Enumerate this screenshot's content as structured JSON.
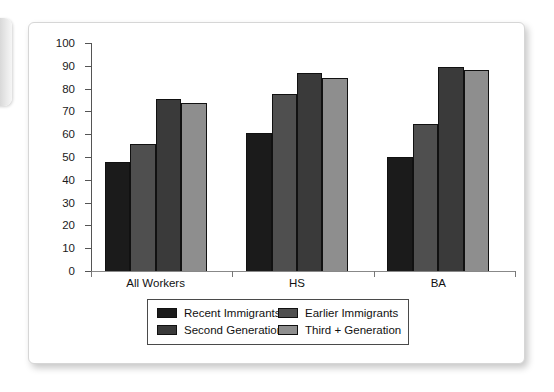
{
  "chart_data": {
    "type": "bar",
    "title": "",
    "xlabel": "",
    "ylabel": "",
    "ylim": [
      0,
      100
    ],
    "ytick_step": 10,
    "grid": false,
    "legend_position": "bottom",
    "categories": [
      "All Workers",
      "HS",
      "BA"
    ],
    "yticks": [
      "100",
      "90",
      "80",
      "70",
      "60",
      "50",
      "40",
      "30",
      "20",
      "10",
      "0"
    ],
    "series": [
      {
        "name": "Recent Immigrants",
        "color": "#1b1b1b",
        "values": [
          48,
          60.5,
          50
        ]
      },
      {
        "name": "Earlier Immigrants",
        "color": "#4f4f4f",
        "values": [
          55.5,
          77.5,
          64.5
        ]
      },
      {
        "name": "Second Generation",
        "color": "#3a3a3a",
        "values": [
          75.5,
          87,
          89.5
        ]
      },
      {
        "name": "Third + Generation",
        "color": "#8e8e8e",
        "values": [
          73.5,
          84.5,
          88
        ]
      }
    ],
    "legend_order": [
      "Recent Immigrants",
      "Earlier Immigrants",
      "Second Generation",
      "Third + Generation"
    ]
  }
}
